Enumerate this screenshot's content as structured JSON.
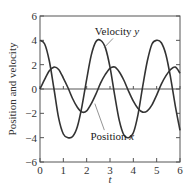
{
  "chart_data": {
    "type": "line",
    "title": "",
    "xlabel": "t",
    "ylabel": "Position and velocity",
    "xlim": [
      0,
      6
    ],
    "ylim": [
      -6,
      6
    ],
    "xticks": [
      0,
      1,
      2,
      3,
      4,
      5,
      6
    ],
    "yticks": [
      -6,
      -4,
      -2,
      0,
      2,
      4,
      6
    ],
    "xtick_labels": [
      "0",
      "1",
      "2",
      "3",
      "4",
      "5",
      "6"
    ],
    "ytick_labels": [
      "−6",
      "−4",
      "−2",
      "0",
      "2",
      "4",
      "6"
    ],
    "grid": false,
    "zero_line": true,
    "legend": null,
    "series": [
      {
        "name": "Velocity y",
        "color": "#333333",
        "x": [
          0,
          0.2,
          0.4,
          0.6,
          0.8,
          1.0,
          1.2,
          1.4,
          1.6,
          1.8,
          2.0,
          2.2,
          2.4,
          2.6,
          2.8,
          3.0,
          3.2,
          3.4,
          3.6,
          3.8,
          4.0,
          4.2,
          4.4,
          4.6,
          4.8,
          5.0,
          5.2,
          5.4,
          5.6,
          5.8,
          6.0
        ],
        "values": [
          4.0,
          3.7,
          2.3,
          0.0,
          -2.4,
          -3.7,
          -4.0,
          -3.9,
          -3.1,
          -1.4,
          0.8,
          2.8,
          3.9,
          4.0,
          3.4,
          1.8,
          -0.5,
          -2.6,
          -3.8,
          -4.0,
          -3.6,
          -2.1,
          0.2,
          2.3,
          3.7,
          4.0,
          3.8,
          2.8,
          0.9,
          -1.4,
          -3.4
        ]
      },
      {
        "name": "Position x",
        "color": "#333333",
        "x": [
          0,
          0.2,
          0.4,
          0.6,
          0.8,
          1.0,
          1.2,
          1.4,
          1.6,
          1.8,
          2.0,
          2.2,
          2.4,
          2.6,
          2.8,
          3.0,
          3.2,
          3.4,
          3.6,
          3.8,
          4.0,
          4.2,
          4.4,
          4.6,
          4.8,
          5.0,
          5.2,
          5.4,
          5.6,
          5.8,
          6.0
        ],
        "values": [
          0.0,
          0.8,
          1.5,
          1.8,
          1.6,
          0.9,
          0.1,
          -0.8,
          -1.5,
          -1.9,
          -1.8,
          -1.2,
          -0.4,
          0.5,
          1.2,
          1.7,
          1.8,
          1.4,
          0.7,
          -0.2,
          -1.0,
          -1.6,
          -1.9,
          -1.8,
          -1.3,
          -0.5,
          0.4,
          1.1,
          1.6,
          1.8,
          1.3
        ]
      }
    ],
    "annotations": [
      {
        "text": "Velocity ",
        "italic_part": "y",
        "x": 3.3,
        "y": 4.4,
        "arrow_to": [
          2.75,
          3.4
        ]
      },
      {
        "text": "Position ",
        "italic_part": "x",
        "x": 3.1,
        "y": -4.2,
        "arrow_to": [
          2.35,
          -1.2
        ]
      }
    ]
  }
}
